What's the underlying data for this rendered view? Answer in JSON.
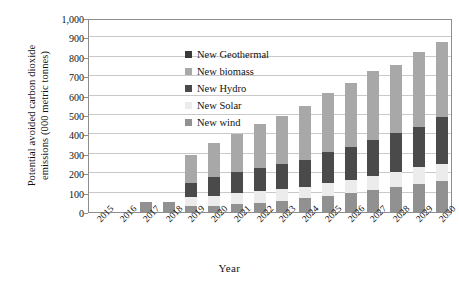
{
  "chart_data": {
    "type": "bar",
    "stacked": true,
    "title": "",
    "xlabel": "Year",
    "ylabel": "Potential avoided carbon dioxide\nemissions (000 metric tonnes)",
    "categories": [
      "2015",
      "2016",
      "2017",
      "2018",
      "2019",
      "2020",
      "2021",
      "2022",
      "2023",
      "2024",
      "2025",
      "2026",
      "2027",
      "2028",
      "2029",
      "2030"
    ],
    "ylim": [
      0,
      1000
    ],
    "yticks": [
      0,
      100,
      200,
      300,
      400,
      500,
      600,
      700,
      800,
      900,
      1000
    ],
    "ytick_labels": [
      "0",
      "100",
      "200",
      "300",
      "400",
      "500",
      "600",
      "700",
      "800",
      "900",
      "1,000"
    ],
    "grid": true,
    "legend_position": "inside-top-left",
    "series": [
      {
        "name": "New wind",
        "color": "#919191",
        "values": [
          0,
          0,
          50,
          50,
          30,
          30,
          40,
          45,
          55,
          70,
          85,
          100,
          115,
          130,
          145,
          160
        ]
      },
      {
        "name": "New Solar",
        "color": "#ececec",
        "values": [
          0,
          0,
          0,
          0,
          45,
          55,
          60,
          65,
          65,
          60,
          65,
          65,
          70,
          75,
          85,
          90
        ]
      },
      {
        "name": "New Hydro",
        "color": "#4a4a4a",
        "values": [
          0,
          0,
          0,
          0,
          75,
          95,
          105,
          115,
          125,
          140,
          160,
          170,
          185,
          200,
          210,
          240
        ]
      },
      {
        "name": "New biomass",
        "color": "#a8a8a8",
        "values": [
          0,
          0,
          0,
          0,
          145,
          175,
          195,
          230,
          250,
          275,
          305,
          330,
          355,
          355,
          385,
          385
        ]
      },
      {
        "name": "New Geothermal",
        "color": "#3a3a3a",
        "values": [
          0,
          0,
          0,
          0,
          0,
          0,
          0,
          0,
          0,
          0,
          0,
          0,
          0,
          0,
          0,
          0
        ]
      }
    ],
    "totals": [
      0,
      0,
      50,
      50,
      295,
      355,
      400,
      455,
      495,
      545,
      615,
      665,
      725,
      760,
      825,
      875
    ],
    "legend_order": [
      "New Geothermal",
      "New biomass",
      "New Hydro",
      "New Solar",
      "New wind"
    ]
  },
  "legend": {
    "items": [
      {
        "label": "New Geothermal",
        "color": "#3a3a3a"
      },
      {
        "label": "New biomass",
        "color": "#a8a8a8"
      },
      {
        "label": "New Hydro",
        "color": "#4a4a4a"
      },
      {
        "label": "New Solar",
        "color": "#ececec"
      },
      {
        "label": "New wind",
        "color": "#919191"
      }
    ]
  },
  "axes": {
    "y_title": "Potential avoided carbon dioxide\nemissions (000 metric tonnes)",
    "x_title": "Year"
  }
}
